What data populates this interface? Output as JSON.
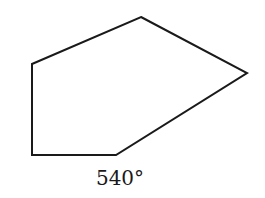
{
  "diagram": {
    "shape": "pentagon",
    "vertices": [
      [
        141,
        17
      ],
      [
        247,
        73
      ],
      [
        116,
        155
      ],
      [
        32,
        155
      ],
      [
        32,
        64
      ]
    ],
    "stroke_color": "#1a1a1a",
    "fill_color": "#ffffff",
    "label": "540°"
  }
}
